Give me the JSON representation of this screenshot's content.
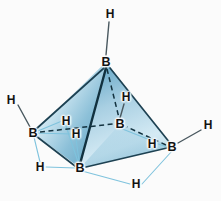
{
  "figure": {
    "background_color": "#fbfbfb",
    "width": 221,
    "height": 201
  },
  "palette": {
    "face_light": "#dfeef5",
    "face_mid": "#9cc8dd",
    "face_dark": "#5f9fbe",
    "face_deep": "#3f88ad",
    "edge_dark": "#1d4152",
    "bond_terminal": "#3a4a52",
    "bond_bridge": "#7fc3dd",
    "label_color": "#121212"
  },
  "atoms": {
    "boron": [
      {
        "id": "B-apex",
        "label": "B",
        "x": 106,
        "y": 62,
        "role": "top-vertex"
      },
      {
        "id": "B-left",
        "label": "B",
        "x": 33,
        "y": 133,
        "role": "left-vertex"
      },
      {
        "id": "B-right",
        "label": "B",
        "x": 172,
        "y": 147,
        "role": "right-vertex"
      },
      {
        "id": "B-front",
        "label": "B",
        "x": 80,
        "y": 168,
        "role": "front-bottom-vertex"
      },
      {
        "id": "B-rear",
        "label": "B",
        "x": 120,
        "y": 124,
        "role": "rear-interior-vertex"
      }
    ],
    "hydrogen": [
      {
        "id": "H-top",
        "label": "H",
        "x": 110,
        "y": 14,
        "type": "terminal"
      },
      {
        "id": "H-left",
        "label": "H",
        "x": 11,
        "y": 100,
        "type": "terminal"
      },
      {
        "id": "H-right",
        "label": "H",
        "x": 208,
        "y": 125,
        "type": "terminal"
      },
      {
        "id": "H-rear-upper",
        "label": "H",
        "x": 126,
        "y": 97,
        "type": "terminal"
      },
      {
        "id": "H-bridge-upper",
        "label": "H",
        "x": 66,
        "y": 121,
        "type": "bridging"
      },
      {
        "id": "H-bridge-inner",
        "label": "H",
        "x": 76,
        "y": 134,
        "type": "bridging"
      },
      {
        "id": "H-bridge-left",
        "label": "H",
        "x": 40,
        "y": 167,
        "type": "bridging"
      },
      {
        "id": "H-bridge-right",
        "label": "H",
        "x": 152,
        "y": 144,
        "type": "bridging"
      },
      {
        "id": "H-bridge-bot",
        "label": "H",
        "x": 136,
        "y": 184,
        "type": "bridging"
      }
    ]
  },
  "bonds": {
    "terminal": [
      {
        "from": "H-top",
        "to": "B-apex"
      },
      {
        "from": "H-left",
        "to": "B-left"
      },
      {
        "from": "H-right",
        "to": "B-right"
      },
      {
        "from": "H-rear-upper",
        "to": "B-rear"
      }
    ],
    "bridging": [
      {
        "from": "B-left",
        "to": "H-bridge-upper"
      },
      {
        "from": "B-left",
        "to": "H-bridge-inner"
      },
      {
        "from": "B-left",
        "to": "H-bridge-left"
      },
      {
        "from": "B-front",
        "to": "H-bridge-upper"
      },
      {
        "from": "B-front",
        "to": "H-bridge-inner"
      },
      {
        "from": "B-front",
        "to": "H-bridge-left"
      },
      {
        "from": "B-front",
        "to": "H-bridge-bot"
      },
      {
        "from": "B-right",
        "to": "H-bridge-bot"
      },
      {
        "from": "B-right",
        "to": "H-bridge-right"
      },
      {
        "from": "B-rear",
        "to": "H-bridge-right"
      }
    ],
    "skeleton_solid": [
      {
        "from": "B-apex",
        "to": "B-left"
      },
      {
        "from": "B-apex",
        "to": "B-right"
      },
      {
        "from": "B-apex",
        "to": "B-front"
      },
      {
        "from": "B-left",
        "to": "B-front"
      },
      {
        "from": "B-front",
        "to": "B-right"
      }
    ],
    "skeleton_dashed": [
      {
        "from": "B-apex",
        "to": "B-rear"
      },
      {
        "from": "B-left",
        "to": "B-rear"
      },
      {
        "from": "B-right",
        "to": "B-rear"
      }
    ]
  }
}
